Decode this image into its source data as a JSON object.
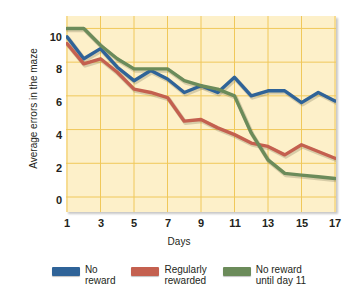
{
  "chart_data": {
    "type": "line",
    "title": "",
    "xlabel": "Days",
    "ylabel": "Average errors in the maze",
    "xlim": [
      1,
      17
    ],
    "ylim": [
      0,
      10.5
    ],
    "xticks": [
      1,
      3,
      5,
      7,
      9,
      11,
      13,
      15,
      17
    ],
    "yticks": [
      0,
      2,
      4,
      6,
      8,
      10
    ],
    "grid": true,
    "legend_position": "bottom",
    "x": [
      1,
      2,
      3,
      4,
      5,
      6,
      7,
      8,
      9,
      10,
      11,
      12,
      13,
      14,
      15,
      16,
      17
    ],
    "series": [
      {
        "name": "No reward",
        "color": "#2f6398",
        "values": [
          9.5,
          8.2,
          8.8,
          7.7,
          6.9,
          7.5,
          7.0,
          6.2,
          6.6,
          6.2,
          7.1,
          6.0,
          6.3,
          6.3,
          5.6,
          6.2,
          5.7
        ]
      },
      {
        "name": "Regularly rewarded",
        "color": "#c4604f",
        "values": [
          9.1,
          7.9,
          8.2,
          7.4,
          6.4,
          6.2,
          5.9,
          4.5,
          4.6,
          4.1,
          3.7,
          3.2,
          3.0,
          2.5,
          3.1,
          2.7,
          2.3
        ]
      },
      {
        "name": "No reward until day 11",
        "color": "#6b8b5a",
        "values": [
          10.0,
          10.0,
          9.0,
          8.2,
          7.6,
          7.6,
          7.6,
          6.9,
          6.6,
          6.4,
          6.0,
          3.8,
          2.2,
          1.4,
          1.3,
          1.2,
          1.1
        ]
      }
    ]
  },
  "axes": {
    "y_title": "Average errors in the maze",
    "x_title": "Days",
    "y_tick_labels": [
      "10",
      "8",
      "6",
      "4",
      "2",
      "0"
    ],
    "x_tick_labels": [
      "1",
      "3",
      "5",
      "7",
      "9",
      "11",
      "13",
      "15",
      "17"
    ]
  },
  "legend": {
    "items": [
      {
        "label": "No\nreward",
        "color": "#2f6398",
        "swatch_name": "legend-swatch-no-reward"
      },
      {
        "label": "Regularly\nrewarded",
        "color": "#c4604f",
        "swatch_name": "legend-swatch-regularly-rewarded"
      },
      {
        "label": "No reward\nuntil day 11",
        "color": "#6b8b5a",
        "swatch_name": "legend-swatch-no-reward-until-day-11"
      }
    ]
  },
  "style": {
    "plot_background": "#fdf0c9",
    "gridline_color": "#f0c85a",
    "text_color": "#231f20"
  }
}
